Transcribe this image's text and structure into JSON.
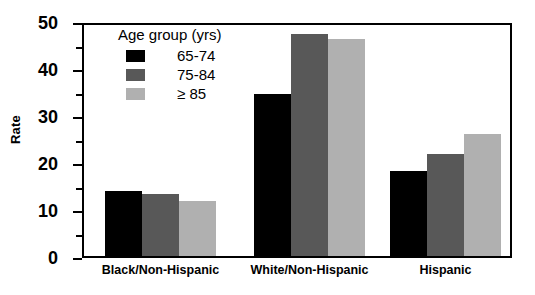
{
  "chart_data": {
    "type": "bar",
    "title": "",
    "xlabel": "",
    "ylabel": "Rate",
    "ylim": [
      0,
      50
    ],
    "ytick_step": 10,
    "yminor_step": 5,
    "grid": false,
    "legend_position": "upper-left-inside",
    "categories": [
      "Black/Non-Hispanic",
      "White/Non-Hispanic",
      "Hispanic"
    ],
    "series": [
      {
        "name": "65-74",
        "color": "#000000",
        "values": [
          14,
          35,
          18.5
        ]
      },
      {
        "name": "75-84",
        "color": "#585858",
        "values": [
          13.5,
          48,
          22
        ]
      },
      {
        "name": "≥ 85",
        "color": "#b0b0b0",
        "values": [
          12,
          47,
          26.5
        ]
      }
    ],
    "ytick_labels": [
      "50",
      "40",
      "30",
      "20",
      "10",
      "0"
    ],
    "ytick_values": [
      50,
      40,
      30,
      20,
      10,
      0
    ],
    "yminor_values": [
      45,
      35,
      25,
      15,
      5
    ]
  },
  "legend": {
    "title": "Age group (yrs)",
    "entries": [
      {
        "label": "65-74"
      },
      {
        "label": "75-84"
      },
      {
        "label": "≥ 85"
      }
    ]
  },
  "axes": {
    "y_title": "Rate"
  }
}
